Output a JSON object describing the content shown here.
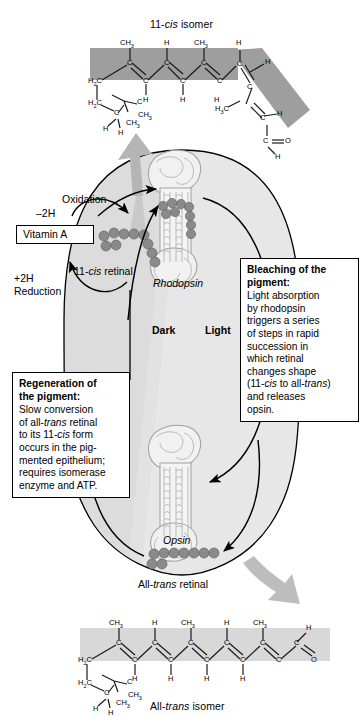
{
  "figure": {
    "title_top": "11-cis isomer",
    "title_bottom": "All-trans isomer"
  },
  "colors": {
    "highlight_band_top": "#9a9a9a",
    "highlight_band_bottom": "#d6d6d6",
    "retinal_bead": "#808080",
    "retinal_bead_stroke": "#5f5f5f",
    "cycle_fill_dark": "#dcdcdc",
    "cycle_fill_light": "#e6e6e6",
    "gray_arrow": "#b3b3b3",
    "protein_outline": "#9d9d9d",
    "line": "#000000",
    "box_bg": "#ffffff"
  },
  "top_structure": {
    "name": "11-cis-retinal-skeletal-formula",
    "title": "11-cis isomer",
    "title_prefix": "11-",
    "title_italic": "cis",
    "title_suffix": " isomer",
    "atom_labels": {
      "methyl": "CH3",
      "hydrogen": "H",
      "carbon": "C",
      "methylene": "H2C",
      "oxygen": "O"
    },
    "top_substituents": [
      "CH3",
      "H",
      "CH3",
      "H"
    ],
    "ring_labels": [
      "H2C",
      "H2C",
      "C",
      "C",
      "CH3",
      "CH3",
      "H",
      "H"
    ],
    "aldehyde": [
      "C",
      "O",
      "H"
    ]
  },
  "bottom_structure": {
    "name": "all-trans-retinal-skeletal-formula",
    "title": "All-trans isomer",
    "title_prefix": "All-",
    "title_italic": "trans",
    "title_suffix": " isomer",
    "top_substituents": [
      "CH3",
      "H",
      "CH3",
      "H",
      "CH3"
    ],
    "bottom_substituents": [
      "H",
      "H",
      "H",
      "H"
    ],
    "ring_labels": [
      "H2C",
      "H2C",
      "C",
      "C",
      "CH3",
      "CH3",
      "H",
      "H"
    ],
    "aldehyde": [
      "H",
      "C",
      "O"
    ]
  },
  "cycle": {
    "dark_label": "Dark",
    "light_label": "Light",
    "rhodopsin_label": "Rhodopsin",
    "opsin_label": "Opsin",
    "retinal_11cis_label": "11-cis retinal",
    "retinal_11cis_prefix": "11-",
    "retinal_11cis_italic": "cis",
    "retinal_11cis_suffix": " retinal",
    "retinal_alltrans_label": "All-trans retinal",
    "retinal_alltrans_prefix": "All-",
    "retinal_alltrans_italic": "trans",
    "retinal_alltrans_suffix": " retinal",
    "vitamin_a_label": "Vitamin A",
    "oxidation_label": "Oxidation",
    "oxidation_electrons": "–2H",
    "reduction_electrons": "+2H",
    "reduction_label": "Reduction"
  },
  "callouts": [
    {
      "name": "bleaching-callout",
      "heading": "Bleaching of the pigment:",
      "heading_line1": "Bleaching of the",
      "heading_line2": "pigment:",
      "body_lines": [
        "Light absorption",
        "by rhodopsin",
        "triggers a series",
        "of steps in rapid",
        "succession in",
        "which retinal",
        "changes shape",
        "(11-cis to all-trans)",
        "and releases",
        "opsin."
      ],
      "body_text": "Light absorption by rhodopsin triggers a series of steps in rapid succession in which retinal changes shape (11-cis to all-trans) and releases opsin."
    },
    {
      "name": "regeneration-callout",
      "heading": "Regeneration of the pigment:",
      "heading_line1": "Regeneration of",
      "heading_line2": "the pigment:",
      "body_lines": [
        "Slow conversion",
        "of all-trans retinal",
        "to its 11-cis form",
        "occurs in the pig-",
        "mented epithelium;",
        "requires isomerase",
        "enzyme and ATP."
      ],
      "body_text": "Slow conversion of all-trans retinal to its 11-cis form occurs in the pigmented epithelium; requires isomerase enzyme and ATP."
    }
  ]
}
